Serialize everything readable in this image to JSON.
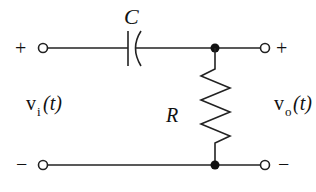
{
  "diagram": {
    "type": "RC high-pass filter circuit",
    "components": {
      "capacitor": {
        "label": "C"
      },
      "resistor": {
        "label": "R"
      }
    },
    "input": {
      "label_main": "v",
      "label_sub": "i",
      "label_arg": "(t)",
      "plus": "+",
      "minus": "−"
    },
    "output": {
      "label_main": "v",
      "label_sub": "o",
      "label_arg": "(t)",
      "plus": "+",
      "minus": "−"
    },
    "colors": {
      "line": "#222222",
      "background": "#ffffff"
    }
  }
}
